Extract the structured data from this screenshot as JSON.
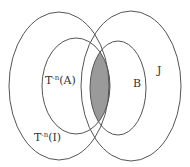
{
  "diagram": {
    "type": "venn",
    "sets": [
      {
        "id": "outer-left",
        "label_base": "T",
        "label_exp": "-n",
        "label_arg": "(I)"
      },
      {
        "id": "inner-left",
        "label_base": "T",
        "label_exp": "-n",
        "label_arg": "(A)"
      },
      {
        "id": "inner-right",
        "label": "B"
      },
      {
        "id": "outer-right",
        "label": "J"
      }
    ],
    "shaded_region": "intersection of T^-n(A) and B",
    "colors": {
      "stroke": "#555555",
      "shade": "#9a9a9a",
      "background": "#ffffff"
    }
  }
}
